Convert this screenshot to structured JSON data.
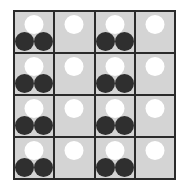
{
  "board": {
    "rows": 4,
    "cols": 4,
    "colors": {
      "cell": "#d4d4d4",
      "grid": "#2a2a2a",
      "white": "#ffffff",
      "black": "#2f2f2f"
    },
    "cells": [
      [
        {
          "white": 1,
          "black": 2
        },
        {
          "white": 1,
          "black": 0
        },
        {
          "white": 1,
          "black": 2
        },
        {
          "white": 1,
          "black": 0
        }
      ],
      [
        {
          "white": 1,
          "black": 2
        },
        {
          "white": 1,
          "black": 0
        },
        {
          "white": 1,
          "black": 2
        },
        {
          "white": 1,
          "black": 0
        }
      ],
      [
        {
          "white": 1,
          "black": 2
        },
        {
          "white": 1,
          "black": 0
        },
        {
          "white": 1,
          "black": 2
        },
        {
          "white": 1,
          "black": 0
        }
      ],
      [
        {
          "white": 1,
          "black": 2
        },
        {
          "white": 1,
          "black": 0
        },
        {
          "white": 1,
          "black": 2
        },
        {
          "white": 1,
          "black": 0
        }
      ]
    ]
  }
}
